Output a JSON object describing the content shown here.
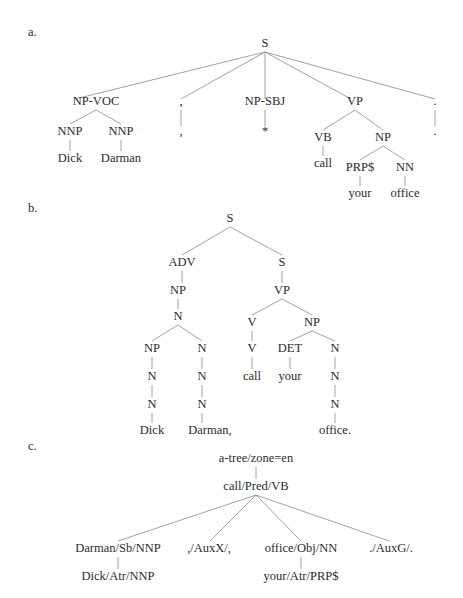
{
  "panels": [
    {
      "id": "a",
      "label": "a.",
      "label_pos": [
        28,
        36
      ],
      "nodes": [
        {
          "id": "S",
          "text": "S",
          "x": 265,
          "y": 47
        },
        {
          "id": "npvoc",
          "text": "NP-VOC",
          "x": 96,
          "y": 105
        },
        {
          "id": "nnp1",
          "text": "NNP",
          "x": 70,
          "y": 135
        },
        {
          "id": "nnp2",
          "text": "NNP",
          "x": 121,
          "y": 135
        },
        {
          "id": "dick",
          "text": "Dick",
          "x": 70,
          "y": 162
        },
        {
          "id": "darman",
          "text": "Darman",
          "x": 121,
          "y": 162
        },
        {
          "id": "comma1",
          "text": ",",
          "x": 181,
          "y": 105
        },
        {
          "id": "comma2",
          "text": ",",
          "x": 181,
          "y": 135
        },
        {
          "id": "npsbj",
          "text": "NP-SBJ",
          "x": 265,
          "y": 105
        },
        {
          "id": "star",
          "text": "*",
          "x": 265,
          "y": 135
        },
        {
          "id": "vp",
          "text": "VP",
          "x": 355,
          "y": 105
        },
        {
          "id": "vb",
          "text": "VB",
          "x": 323,
          "y": 141
        },
        {
          "id": "np",
          "text": "NP",
          "x": 383,
          "y": 141
        },
        {
          "id": "call",
          "text": "call",
          "x": 323,
          "y": 167
        },
        {
          "id": "prp",
          "text": "PRP$",
          "x": 360,
          "y": 171
        },
        {
          "id": "nn",
          "text": "NN",
          "x": 405,
          "y": 171
        },
        {
          "id": "your",
          "text": "your",
          "x": 360,
          "y": 197
        },
        {
          "id": "office",
          "text": "office",
          "x": 405,
          "y": 197
        },
        {
          "id": "per1",
          "text": ".",
          "x": 435,
          "y": 105
        },
        {
          "id": "per2",
          "text": ".",
          "x": 435,
          "y": 135
        }
      ],
      "edges": [
        [
          265,
          52,
          75,
          99
        ],
        [
          265,
          52,
          181,
          99
        ],
        [
          265,
          52,
          265,
          99
        ],
        [
          265,
          52,
          351,
          99
        ],
        [
          265,
          52,
          435,
          99
        ],
        [
          96,
          110,
          70,
          124
        ],
        [
          96,
          110,
          121,
          124
        ],
        [
          70,
          140,
          70,
          151
        ],
        [
          121,
          140,
          121,
          151
        ],
        [
          181,
          110,
          181,
          126
        ],
        [
          265,
          110,
          265,
          126
        ],
        [
          355,
          110,
          323,
          130
        ],
        [
          355,
          110,
          383,
          130
        ],
        [
          323,
          146,
          323,
          156
        ],
        [
          383,
          146,
          360,
          160
        ],
        [
          383,
          146,
          405,
          160
        ],
        [
          360,
          176,
          360,
          186
        ],
        [
          405,
          176,
          405,
          186
        ],
        [
          435,
          110,
          435,
          126
        ]
      ]
    },
    {
      "id": "b",
      "label": "b.",
      "label_pos": [
        28,
        212
      ],
      "nodes": [
        {
          "id": "S",
          "text": "S",
          "x": 230,
          "y": 222
        },
        {
          "id": "adv",
          "text": "ADV",
          "x": 182,
          "y": 266
        },
        {
          "id": "s2",
          "text": "S",
          "x": 282,
          "y": 266
        },
        {
          "id": "np1",
          "text": "NP",
          "x": 178,
          "y": 294
        },
        {
          "id": "vp",
          "text": "VP",
          "x": 282,
          "y": 294
        },
        {
          "id": "n1",
          "text": "N",
          "x": 178,
          "y": 320
        },
        {
          "id": "np2",
          "text": "NP",
          "x": 152,
          "y": 352
        },
        {
          "id": "n2",
          "text": "N",
          "x": 202,
          "y": 352
        },
        {
          "id": "n3",
          "text": "N",
          "x": 152,
          "y": 380
        },
        {
          "id": "n4",
          "text": "N",
          "x": 202,
          "y": 380
        },
        {
          "id": "n5",
          "text": "N",
          "x": 152,
          "y": 408
        },
        {
          "id": "n6",
          "text": "N",
          "x": 202,
          "y": 408
        },
        {
          "id": "dick",
          "text": "Dick",
          "x": 152,
          "y": 434
        },
        {
          "id": "darman",
          "text": "Darman,",
          "x": 210,
          "y": 434
        },
        {
          "id": "v1",
          "text": "V",
          "x": 252,
          "y": 326
        },
        {
          "id": "np3",
          "text": "NP",
          "x": 312,
          "y": 326
        },
        {
          "id": "v2",
          "text": "V",
          "x": 252,
          "y": 352
        },
        {
          "id": "call",
          "text": "call",
          "x": 252,
          "y": 380
        },
        {
          "id": "det",
          "text": "DET",
          "x": 290,
          "y": 352
        },
        {
          "id": "your",
          "text": "your",
          "x": 290,
          "y": 380
        },
        {
          "id": "n7",
          "text": "N",
          "x": 335,
          "y": 352
        },
        {
          "id": "n8",
          "text": "N",
          "x": 335,
          "y": 380
        },
        {
          "id": "n9",
          "text": "N",
          "x": 335,
          "y": 408
        },
        {
          "id": "office",
          "text": "office.",
          "x": 335,
          "y": 434
        }
      ],
      "edges": [
        [
          230,
          227,
          182,
          255
        ],
        [
          230,
          227,
          282,
          255
        ],
        [
          182,
          271,
          182,
          283
        ],
        [
          282,
          271,
          282,
          283
        ],
        [
          178,
          299,
          178,
          309
        ],
        [
          178,
          325,
          152,
          341
        ],
        [
          178,
          325,
          202,
          341
        ],
        [
          152,
          357,
          152,
          369
        ],
        [
          202,
          357,
          202,
          369
        ],
        [
          152,
          385,
          152,
          397
        ],
        [
          202,
          385,
          202,
          397
        ],
        [
          152,
          413,
          152,
          423
        ],
        [
          202,
          413,
          202,
          423
        ],
        [
          282,
          299,
          252,
          315
        ],
        [
          282,
          299,
          312,
          315
        ],
        [
          252,
          331,
          252,
          341
        ],
        [
          252,
          357,
          252,
          369
        ],
        [
          312,
          331,
          290,
          341
        ],
        [
          312,
          331,
          335,
          341
        ],
        [
          290,
          357,
          290,
          369
        ],
        [
          335,
          357,
          335,
          369
        ],
        [
          335,
          385,
          335,
          397
        ],
        [
          335,
          413,
          335,
          423
        ]
      ]
    },
    {
      "id": "c",
      "label": "c.",
      "label_pos": [
        28,
        450
      ],
      "nodes": [
        {
          "id": "root",
          "text": "a-tree/zone=en",
          "x": 256,
          "y": 462
        },
        {
          "id": "call",
          "text": "call/Pred/VB",
          "x": 256,
          "y": 490
        },
        {
          "id": "darman",
          "text": "Darman/Sb/NNP",
          "x": 118,
          "y": 552
        },
        {
          "id": "comma",
          "text": ",/AuxX/,",
          "x": 209,
          "y": 552
        },
        {
          "id": "office",
          "text": "office/Obj/NN",
          "x": 301,
          "y": 552
        },
        {
          "id": "period",
          "text": "./AuxG/.",
          "x": 391,
          "y": 552
        },
        {
          "id": "dick",
          "text": "Dick/Atr/NNP",
          "x": 118,
          "y": 580
        },
        {
          "id": "your",
          "text": "your/Atr/PRP$",
          "x": 301,
          "y": 580
        }
      ],
      "edges": [
        [
          256,
          467,
          256,
          479
        ],
        [
          256,
          495,
          118,
          541
        ],
        [
          256,
          495,
          210,
          541
        ],
        [
          256,
          495,
          301,
          541
        ],
        [
          256,
          495,
          389,
          541
        ],
        [
          118,
          557,
          118,
          569
        ],
        [
          301,
          557,
          301,
          569
        ]
      ]
    }
  ]
}
